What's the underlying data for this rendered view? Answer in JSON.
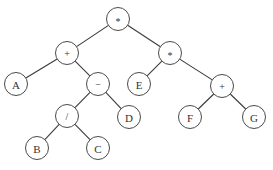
{
  "diagram": {
    "type": "expression-tree",
    "colors": {
      "edge": "#3a3a3a",
      "node_stroke": "#4a4a4a",
      "node_fill": "#ffffff",
      "label": "#333333",
      "background": "#ffffff"
    },
    "node_radius": 11.5,
    "nodes": [
      {
        "id": "root",
        "label": "*",
        "kind": "operator",
        "x": 118,
        "y": 19
      },
      {
        "id": "plus-left",
        "label": "+",
        "kind": "operator",
        "x": 67,
        "y": 53
      },
      {
        "id": "times-right",
        "label": "*",
        "kind": "operator",
        "x": 170,
        "y": 53
      },
      {
        "id": "A",
        "label": "A",
        "kind": "operand",
        "x": 16,
        "y": 84
      },
      {
        "id": "minus",
        "label": "−",
        "kind": "operator",
        "x": 98,
        "y": 84
      },
      {
        "id": "E",
        "label": "E",
        "kind": "operand",
        "x": 139,
        "y": 84
      },
      {
        "id": "plus-right",
        "label": "+",
        "kind": "operator",
        "x": 222,
        "y": 86
      },
      {
        "id": "divide",
        "label": "/",
        "kind": "operator",
        "x": 67,
        "y": 116
      },
      {
        "id": "D",
        "label": "D",
        "kind": "operand",
        "x": 129,
        "y": 117
      },
      {
        "id": "F",
        "label": "F",
        "kind": "operand",
        "x": 190,
        "y": 117
      },
      {
        "id": "G",
        "label": "G",
        "kind": "operand",
        "x": 254,
        "y": 117
      },
      {
        "id": "B",
        "label": "B",
        "kind": "operand",
        "x": 37,
        "y": 148
      },
      {
        "id": "C",
        "label": "C",
        "kind": "operand",
        "x": 98,
        "y": 148
      }
    ],
    "edges": [
      {
        "from": "root",
        "to": "plus-left"
      },
      {
        "from": "root",
        "to": "times-right"
      },
      {
        "from": "plus-left",
        "to": "A"
      },
      {
        "from": "plus-left",
        "to": "minus"
      },
      {
        "from": "times-right",
        "to": "E"
      },
      {
        "from": "times-right",
        "to": "plus-right"
      },
      {
        "from": "minus",
        "to": "divide"
      },
      {
        "from": "minus",
        "to": "D"
      },
      {
        "from": "plus-right",
        "to": "F"
      },
      {
        "from": "plus-right",
        "to": "G"
      },
      {
        "from": "divide",
        "to": "B"
      },
      {
        "from": "divide",
        "to": "C"
      }
    ]
  }
}
